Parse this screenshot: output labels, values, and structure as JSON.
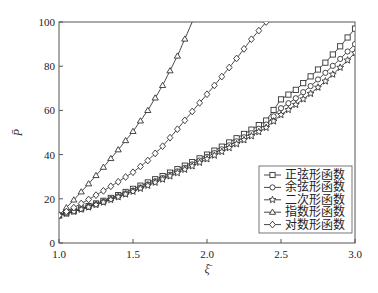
{
  "chart_data": {
    "type": "line",
    "title": "",
    "xlabel": "ξ̄",
    "ylabel": "P̄",
    "xlim": [
      1.0,
      3.0
    ],
    "ylim": [
      0,
      100
    ],
    "xticks": [
      1.0,
      1.5,
      2.0,
      2.5,
      3.0
    ],
    "xtick_labels": [
      "1.0",
      "1.5",
      "2.0",
      "2.5",
      "3.0"
    ],
    "yticks": [
      0,
      20,
      40,
      60,
      80,
      100
    ],
    "ytick_labels": [
      "0",
      "20",
      "40",
      "60",
      "80",
      "100"
    ],
    "grid": false,
    "legend_position": "lower right",
    "x": [
      1.0,
      1.1,
      1.2,
      1.3,
      1.4,
      1.5,
      1.6,
      1.7,
      1.8,
      1.9,
      2.0,
      2.1,
      2.2,
      2.3,
      2.4,
      2.5,
      2.6,
      2.7,
      2.8,
      2.9,
      3.0
    ],
    "series": [
      {
        "name": "正弦形函数",
        "marker": "square",
        "values": [
          12.5,
          14.5,
          16.7,
          19.1,
          21.7,
          24.5,
          27.4,
          30.3,
          33.4,
          36.6,
          40.0,
          43.6,
          47.4,
          51.3,
          55.4,
          65.0,
          69.3,
          75.4,
          81.6,
          89.0,
          97.0
        ]
      },
      {
        "name": "余弦形函数",
        "marker": "circle",
        "values": [
          12.5,
          14.3,
          16.4,
          18.6,
          21.1,
          23.7,
          26.5,
          29.4,
          32.4,
          35.6,
          39.0,
          42.4,
          46.0,
          49.7,
          53.6,
          61.0,
          65.5,
          71.0,
          77.0,
          83.3,
          90.0
        ]
      },
      {
        "name": "二次形函数",
        "marker": "star",
        "values": [
          12.5,
          14.2,
          16.2,
          18.4,
          20.8,
          23.3,
          26.0,
          28.8,
          31.7,
          34.8,
          38.0,
          41.3,
          44.8,
          48.4,
          52.2,
          58.0,
          62.6,
          67.6,
          73.2,
          79.4,
          86.0
        ]
      },
      {
        "name": "指数形函数",
        "marker": "triangle",
        "values": [
          12.5,
          19.5,
          26.8,
          34.3,
          42.2,
          50.5,
          60.0,
          71.3,
          84.6,
          100.0,
          null,
          null,
          null,
          null,
          null,
          null,
          null,
          null,
          null,
          null,
          null
        ]
      },
      {
        "name": "对数形函数",
        "marker": "diamond",
        "values": [
          12.5,
          16.0,
          19.7,
          23.6,
          27.7,
          32.0,
          37.3,
          43.8,
          51.5,
          59.5,
          67.3,
          75.3,
          83.5,
          92.2,
          100.0,
          null,
          null,
          null,
          null,
          null,
          null
        ]
      }
    ]
  }
}
